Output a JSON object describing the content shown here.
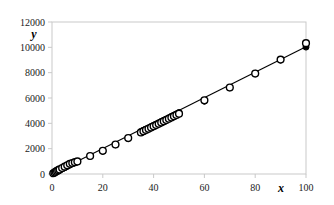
{
  "chart_data": {
    "type": "scatter",
    "title": "",
    "xlabel": "x",
    "ylabel": "y",
    "xlim": [
      0,
      100
    ],
    "ylim": [
      0,
      12000
    ],
    "xticks": [
      0,
      20,
      40,
      60,
      80,
      100
    ],
    "yticks": [
      0,
      2000,
      4000,
      6000,
      8000,
      10000,
      12000
    ],
    "xtick_labels": [
      "0",
      "20",
      "40",
      "60",
      "80",
      "100"
    ],
    "ytick_labels": [
      "0",
      "2000",
      "4000",
      "6000",
      "8000",
      "10000",
      "12000"
    ],
    "grid": false,
    "legend": "none",
    "frame_color": "#c9c9c9",
    "marker_color": "#000000",
    "line_color": "#000000",
    "series": [
      {
        "name": "filled",
        "marker": "filled-circle",
        "x": [
          0.5,
          1,
          1.5,
          2,
          2.5,
          3,
          4,
          5,
          6,
          7,
          8,
          9,
          10,
          15,
          20,
          25,
          30,
          35,
          36,
          37,
          38,
          39,
          40,
          41,
          42,
          43,
          44,
          45,
          46,
          47,
          48,
          49,
          50,
          60,
          70,
          80,
          90,
          100
        ],
        "y": [
          50,
          100,
          150,
          200,
          250,
          300,
          400,
          500,
          600,
          700,
          800,
          880,
          950,
          1400,
          1800,
          2300,
          2800,
          3350,
          3450,
          3550,
          3650,
          3750,
          3850,
          3950,
          4050,
          4150,
          4250,
          4350,
          4450,
          4550,
          4650,
          4750,
          4850,
          5750,
          6800,
          7950,
          9000,
          10020
        ]
      },
      {
        "name": "open",
        "marker": "open-circle",
        "x": [
          0.5,
          1,
          1.5,
          2,
          2.5,
          3,
          4,
          5,
          6,
          7,
          8,
          9,
          10,
          15,
          20,
          25,
          30,
          35,
          36,
          37,
          38,
          39,
          40,
          41,
          42,
          43,
          44,
          45,
          46,
          47,
          48,
          49,
          50,
          60,
          70,
          80,
          90,
          100
        ],
        "y": [
          60,
          120,
          180,
          240,
          300,
          360,
          470,
          580,
          690,
          800,
          870,
          930,
          990,
          1420,
          1830,
          2330,
          2840,
          3280,
          3380,
          3480,
          3570,
          3670,
          3770,
          3860,
          3960,
          4060,
          4160,
          4260,
          4360,
          4460,
          4560,
          4660,
          4760,
          5820,
          6830,
          7930,
          9030,
          10330
        ]
      }
    ],
    "fit_line": {
      "name": "fit",
      "x": [
        0,
        100
      ],
      "y": [
        0,
        10050
      ]
    }
  }
}
